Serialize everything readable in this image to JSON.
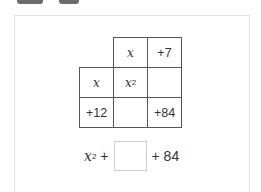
{
  "toolbar": {
    "tabs": [
      {
        "label": ""
      },
      {
        "label": ""
      }
    ]
  },
  "area_model": {
    "column_headers": [
      "x",
      "+7"
    ],
    "row_headers": [
      "x",
      "+12"
    ],
    "cells": [
      [
        "x",
        "2",
        ""
      ],
      [
        "",
        "+84"
      ]
    ],
    "top_left": "x",
    "top_left_exp": "2",
    "bottom_right": "+84"
  },
  "expression": {
    "term1_base": "x",
    "term1_exp": "2",
    "plus1": "+",
    "blank_value": "",
    "plus2": "+ 84"
  }
}
